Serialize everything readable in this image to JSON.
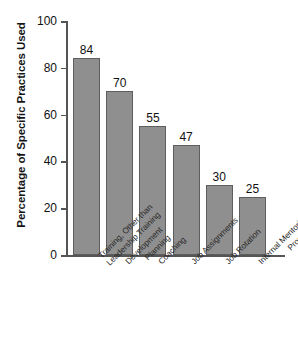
{
  "chart_data": {
    "type": "bar",
    "title": "",
    "xlabel": "",
    "ylabel": "Percentage of Specific Practices Used",
    "ylim": [
      0,
      100
    ],
    "yticks": [
      0,
      20,
      40,
      60,
      80,
      100
    ],
    "grid": false,
    "legend": false,
    "categories": [
      "Training, Other than Leadership Training",
      "Development Planning",
      "Coaching",
      "Job Assignments",
      "Job Rotation",
      "Internal Mentoring Programs"
    ],
    "category_lines": [
      [
        "Training, Other than",
        "Leadership Training"
      ],
      [
        "Development",
        "Planning"
      ],
      [
        "Coaching",
        ""
      ],
      [
        "Job Assignments",
        ""
      ],
      [
        "Job Rotation",
        ""
      ],
      [
        "Internal Mentoring",
        "Programs"
      ]
    ],
    "values": [
      84,
      70,
      55,
      47,
      30,
      25
    ],
    "value_labels": [
      "84",
      "70",
      "55",
      "47",
      "30",
      "25"
    ],
    "colors": {
      "bar_fill": "#8f8f8f",
      "bar_stroke": "#5e5e5e",
      "axis": "#555555",
      "text": "#111111",
      "background": "#ffffff"
    }
  }
}
